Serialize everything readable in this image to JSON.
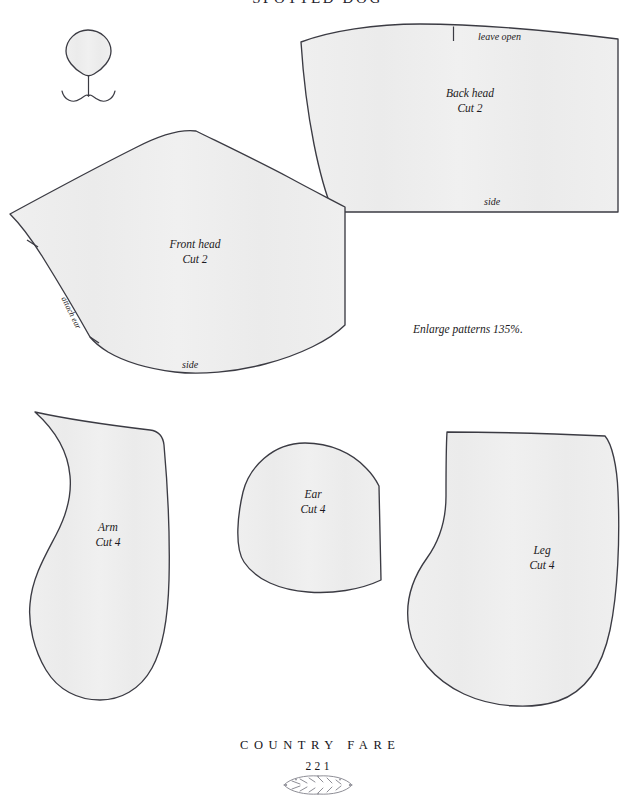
{
  "page": {
    "title": "SPOTTED DOG",
    "width": 635,
    "height": 796,
    "background_color": "#ffffff"
  },
  "style": {
    "piece_fill": "#eeeeee",
    "piece_stroke": "#3b3b43",
    "ink_color": "#1c1a22",
    "paper_color": "#ffffff"
  },
  "instructions": {
    "enlarge_note": "Enlarge patterns 135%."
  },
  "diagrams": [
    {
      "id": "nose-mouth-guide",
      "name": "nose-and-mouth-embroidery-guide",
      "label": ""
    }
  ],
  "pattern_pieces": [
    {
      "id": "back-head",
      "name": "Back head",
      "cut": "Cut 2",
      "edge_labels": [
        {
          "text": "leave open",
          "position": "top-right"
        },
        {
          "text": "side",
          "position": "bottom"
        }
      ],
      "notches": 1
    },
    {
      "id": "front-head",
      "name": "Front head",
      "cut": "Cut 2",
      "edge_labels": [
        {
          "text": "attach ear",
          "position": "left-edge-rotated"
        },
        {
          "text": "side",
          "position": "bottom"
        }
      ],
      "notches": 2
    },
    {
      "id": "arm",
      "name": "Arm",
      "cut": "Cut 4",
      "edge_labels": [],
      "notches": 0
    },
    {
      "id": "ear",
      "name": "Ear",
      "cut": "Cut 4",
      "edge_labels": [],
      "notches": 0
    },
    {
      "id": "leg",
      "name": "Leg",
      "cut": "Cut 4",
      "edge_labels": [],
      "notches": 0
    }
  ],
  "footer": {
    "book_section": "COUNTRY FARE",
    "page_number": "221",
    "ornament": "laurel-wreath"
  }
}
